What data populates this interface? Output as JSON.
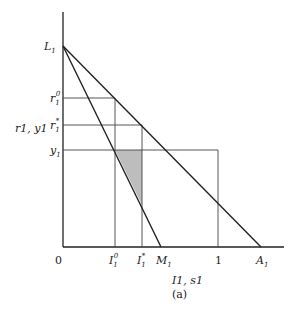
{
  "figure": {
    "caption": "(a)",
    "x_axis_label": "I1, s1",
    "y_axis_label": "r1, y1",
    "origin_label": "0"
  },
  "y_labels": {
    "L1": "L",
    "r1_0": "r",
    "r1_star": "r",
    "y1": "y"
  },
  "x_labels": {
    "I1_0": "I",
    "I1_star": "I",
    "M1": "M",
    "one": "1",
    "A1": "A"
  },
  "superscripts": {
    "zero": "0",
    "star": "*"
  },
  "subscript": "1",
  "colors": {
    "line": "#222222",
    "shade": "#bdbdbd"
  }
}
